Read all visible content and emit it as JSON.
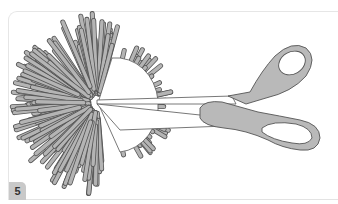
{
  "step": {
    "number": "5",
    "label": "Step number"
  },
  "illustration": {
    "subject": "pom-pom being cut with scissors",
    "colors": {
      "strand_fill": "#b4b4b4",
      "strand_stroke": "#555555",
      "scissors_fill": "#b9b9b9",
      "scissors_stroke": "#555555",
      "disc_fill": "#ffffff"
    }
  }
}
